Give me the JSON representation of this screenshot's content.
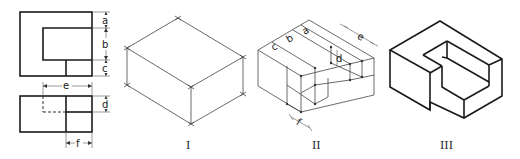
{
  "figure": {
    "orthographic": {
      "front_view": {
        "dimensions": [
          "a",
          "b",
          "c"
        ]
      },
      "top_view": {
        "dimensions": [
          "e",
          "d",
          "f"
        ]
      }
    },
    "isometric_steps": [
      {
        "label": "I",
        "description": "bounding box"
      },
      {
        "label": "II",
        "description": "construction with dimensions",
        "dimensions": [
          "c",
          "b",
          "a",
          "e",
          "d",
          "f"
        ]
      },
      {
        "label": "III",
        "description": "finished object"
      }
    ]
  }
}
